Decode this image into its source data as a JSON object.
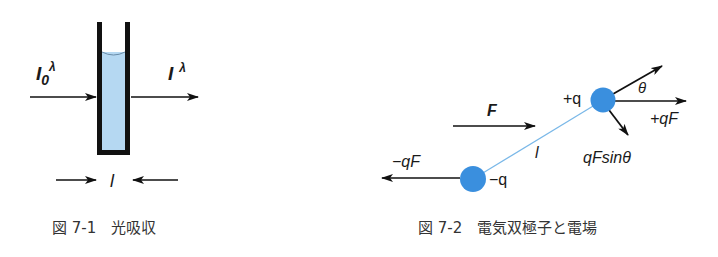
{
  "figure1": {
    "caption": "図 7-1　光吸収",
    "incident_label": "I",
    "incident_sub": "0",
    "incident_sup": "λ",
    "transmitted_label": "I",
    "transmitted_sup": "λ",
    "pathlength_label": "l",
    "liquid_color": "#b5d8f2",
    "cell_color": "#111111"
  },
  "figure2": {
    "caption": "図 7-2　電気双極子と電場",
    "field_label": "F",
    "positive_charge": "+q",
    "negative_charge": "−q",
    "positive_force": "+qF",
    "negative_force": "−qF",
    "torque_component": "qFsinθ",
    "angle_label": "θ",
    "length_label": "l",
    "charge_color": "#3a8fde",
    "rod_color": "#7ab8e8"
  }
}
